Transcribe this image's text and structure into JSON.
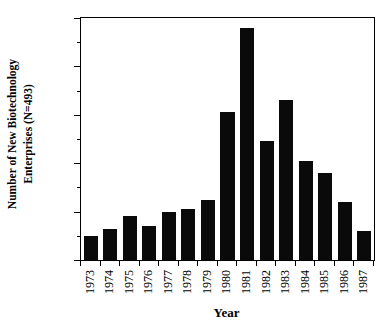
{
  "chart_data": {
    "type": "bar",
    "title": "",
    "xlabel": "Year",
    "ylabel": "Number of New Biotechnology Enterprises (N=493)",
    "ylabel_line1": "Number of New Biotechnology",
    "ylabel_line2": "Enterprises (N=493)",
    "categories": [
      "1973",
      "1974",
      "1975",
      "1976",
      "1977",
      "1978",
      "1979",
      "1980",
      "1981",
      "1982",
      "1983",
      "1984",
      "1985",
      "1986",
      "1987"
    ],
    "values": [
      10,
      13,
      18,
      14,
      20,
      21,
      25,
      61,
      96,
      49,
      66,
      41,
      36,
      24,
      12
    ],
    "ylim": [
      0,
      100
    ],
    "ytick_major": [
      0,
      20,
      40,
      60,
      80,
      100
    ],
    "ytick_major_labels": [
      "0",
      "20",
      "40",
      "60",
      "80",
      "100"
    ],
    "ytick_minor": [
      10,
      30,
      50,
      70,
      90
    ],
    "grid": false,
    "legend": false,
    "bar_color": "#0a0a0a",
    "axis_color": "#000000",
    "background": "#ffffff",
    "n_total": 493
  }
}
